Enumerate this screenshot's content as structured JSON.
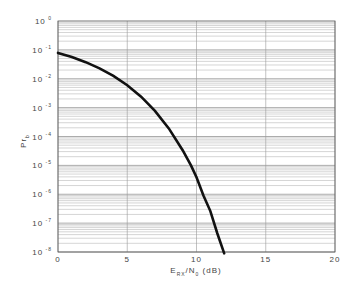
{
  "chart_data": {
    "type": "line",
    "title": "",
    "xlabel": "E_RX/N_0 (dB)",
    "xlabel_parts": {
      "main1": "E",
      "sub1": "RX",
      "main2": "/N",
      "sub2": "0",
      "tail": " (dB)"
    },
    "ylabel": "Pr_b",
    "ylabel_parts": {
      "main": "Pr",
      "sub": "b"
    },
    "xlim": [
      0,
      20
    ],
    "ylim": [
      1e-08,
      1
    ],
    "yscale": "log",
    "grid": true,
    "x_ticks": [
      "0",
      "5",
      "10",
      "15",
      "20"
    ],
    "y_ticks": [
      {
        "base": "10",
        "exp": "0"
      },
      {
        "base": "10",
        "exp": "-1"
      },
      {
        "base": "10",
        "exp": "-2"
      },
      {
        "base": "10",
        "exp": "-3"
      },
      {
        "base": "10",
        "exp": "-4"
      },
      {
        "base": "10",
        "exp": "-5"
      },
      {
        "base": "10",
        "exp": "-6"
      },
      {
        "base": "10",
        "exp": "-7"
      },
      {
        "base": "10",
        "exp": "-8"
      }
    ],
    "series": [
      {
        "name": "Pr_b",
        "color": "#111111",
        "x": [
          0,
          1,
          2,
          3,
          4,
          5,
          6,
          7,
          8,
          9,
          9.6,
          10,
          10.5,
          11,
          11.5,
          12
        ],
        "y": [
          0.0786,
          0.0563,
          0.0375,
          0.0229,
          0.0125,
          0.00595,
          0.00239,
          0.000773,
          0.000191,
          3.36e-05,
          1e-05,
          3.87e-06,
          9.07e-07,
          2.61e-07,
          4.47e-08,
          9e-09
        ]
      }
    ]
  }
}
